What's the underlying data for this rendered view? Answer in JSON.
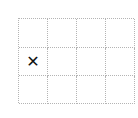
{
  "board": {
    "rows": 3,
    "cols": 4,
    "line_color": "#b4b4b4",
    "mark_color": "#111111",
    "cells": [
      [
        "",
        "",
        "",
        ""
      ],
      [
        "✕",
        "",
        "",
        ""
      ],
      [
        "",
        "",
        "",
        ""
      ]
    ]
  }
}
